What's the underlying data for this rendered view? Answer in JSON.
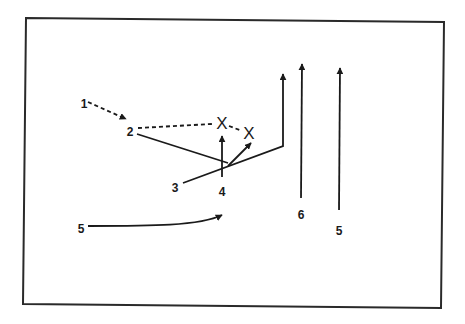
{
  "diagram": {
    "type": "play-diagram",
    "colors": {
      "ink": "#1a1a1a",
      "background": "#ffffff",
      "frame": "#2a2a2a"
    },
    "frame": {
      "points": [
        [
          26,
          18
        ],
        [
          444,
          22
        ],
        [
          441,
          308
        ],
        [
          23,
          304
        ]
      ]
    },
    "players": [
      {
        "id": "p1",
        "label": "1",
        "x": 84,
        "y": 104
      },
      {
        "id": "p2",
        "label": "2",
        "x": 130,
        "y": 132
      },
      {
        "id": "p3",
        "label": "3",
        "x": 175,
        "y": 188
      },
      {
        "id": "p4",
        "label": "4",
        "x": 222,
        "y": 192
      },
      {
        "id": "p5-left",
        "label": "5",
        "x": 81,
        "y": 229
      },
      {
        "id": "p6",
        "label": "6",
        "x": 301,
        "y": 215
      },
      {
        "id": "p5-right",
        "label": "5",
        "x": 339,
        "y": 231
      }
    ],
    "defenders": [
      {
        "id": "x1",
        "label": "X",
        "x": 222,
        "y": 123
      },
      {
        "id": "x2",
        "label": "X",
        "x": 249,
        "y": 133
      }
    ],
    "paths": [
      {
        "id": "p1-dashed-move",
        "style": "dashed",
        "d": "M 88 102 L 126 119",
        "arrow": true
      },
      {
        "id": "p2-dashed-pass",
        "style": "dashed",
        "d": "M 138 128 L 212 124",
        "arrow": false
      },
      {
        "id": "defender-dashed-link",
        "style": "dashed",
        "d": "M 229 126 L 242 131",
        "arrow": false
      },
      {
        "id": "p2-cut",
        "style": "solid",
        "d": "M 137 134 L 228 163",
        "arrow": false
      },
      {
        "id": "p3-route",
        "style": "solid",
        "d": "M 183 183 L 283 146 L 283 74",
        "arrow": true
      },
      {
        "id": "p4-up",
        "style": "solid",
        "d": "M 222 177 L 222 136",
        "arrow": true
      },
      {
        "id": "p4-diag",
        "style": "solid",
        "d": "M 228 166 L 251 143",
        "arrow": true
      },
      {
        "id": "p6-route",
        "style": "solid",
        "d": "M 301 198 L 302 64",
        "arrow": true
      },
      {
        "id": "p5-right-route",
        "style": "solid",
        "d": "M 339 210 L 340 68",
        "arrow": true
      },
      {
        "id": "p5-left-curve",
        "style": "solid",
        "d": "M 88 226 C 150 226 200 226 222 215",
        "arrow": true
      }
    ]
  }
}
